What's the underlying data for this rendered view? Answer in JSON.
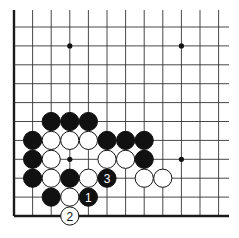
{
  "diagram": {
    "type": "go-board-fragment",
    "colors": {
      "black": "#111111",
      "white": "#ffffff",
      "line": "#333333",
      "edge": "#1a1a1a"
    },
    "grid": {
      "columns": 12,
      "rows": 11,
      "left_edge_visible": true,
      "bottom_edge_visible": true,
      "origin_x": 14,
      "origin_y": 216,
      "spacing_x": 18.6,
      "spacing_y": 18.9,
      "top_extent_y": 10,
      "right_extent_x": 229
    },
    "star_points": [
      {
        "col": 3,
        "row": 9
      },
      {
        "col": 9,
        "row": 9
      },
      {
        "col": 3,
        "row": 3
      },
      {
        "col": 9,
        "row": 3
      }
    ],
    "stones": [
      {
        "color": "black",
        "col": 2,
        "row": 5
      },
      {
        "color": "black",
        "col": 3,
        "row": 5
      },
      {
        "color": "black",
        "col": 4,
        "row": 5
      },
      {
        "color": "black",
        "col": 1,
        "row": 4
      },
      {
        "color": "white",
        "col": 2,
        "row": 4
      },
      {
        "color": "white",
        "col": 3,
        "row": 4
      },
      {
        "color": "white",
        "col": 4,
        "row": 4
      },
      {
        "color": "black",
        "col": 5,
        "row": 4
      },
      {
        "color": "black",
        "col": 6,
        "row": 4
      },
      {
        "color": "black",
        "col": 7,
        "row": 4
      },
      {
        "color": "black",
        "col": 1,
        "row": 3
      },
      {
        "color": "white",
        "col": 2,
        "row": 3
      },
      {
        "color": "white",
        "col": 5,
        "row": 3
      },
      {
        "color": "white",
        "col": 6,
        "row": 3
      },
      {
        "color": "black",
        "col": 7,
        "row": 3
      },
      {
        "color": "black",
        "col": 1,
        "row": 2
      },
      {
        "color": "white",
        "col": 2,
        "row": 2
      },
      {
        "color": "black",
        "col": 3,
        "row": 2
      },
      {
        "color": "white",
        "col": 4,
        "row": 2
      },
      {
        "color": "black",
        "col": 5,
        "row": 2,
        "label": "3"
      },
      {
        "color": "white",
        "col": 7,
        "row": 2
      },
      {
        "color": "white",
        "col": 8,
        "row": 2
      },
      {
        "color": "black",
        "col": 2,
        "row": 1
      },
      {
        "color": "white",
        "col": 3,
        "row": 1
      },
      {
        "color": "black",
        "col": 4,
        "row": 1,
        "label": "1"
      },
      {
        "color": "white",
        "col": 3,
        "row": 0,
        "label": "2"
      }
    ],
    "move_sequence": [
      {
        "move": "1",
        "color": "black"
      },
      {
        "move": "2",
        "color": "white"
      },
      {
        "move": "3",
        "color": "black"
      }
    ]
  }
}
